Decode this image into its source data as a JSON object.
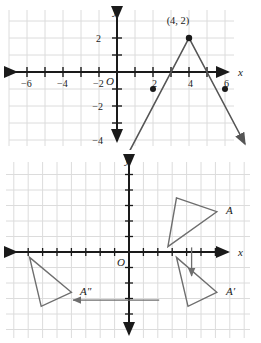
{
  "figure_top": {
    "name": "absolute-value-graph",
    "axis": {
      "x_label": "x",
      "y_label": "y",
      "origin_label": "O",
      "x_ticks": [
        -6,
        -4,
        -2,
        2,
        4,
        6
      ],
      "x_tick_labels": [
        "−6",
        "−4",
        "−2",
        "2",
        "4",
        "6"
      ],
      "y_ticks": [
        -4,
        -2,
        2
      ],
      "y_tick_labels": [
        "−4",
        "−2",
        "2"
      ],
      "x_range": [
        -7,
        7
      ],
      "y_range": [
        -5,
        3
      ]
    },
    "annotations": [
      {
        "text": "(4, 2)",
        "x": 4,
        "y": 2
      }
    ],
    "points": [
      {
        "x": 2,
        "y": -1
      },
      {
        "x": 4,
        "y": 2
      },
      {
        "x": 6,
        "y": -1
      }
    ],
    "polyline": [
      {
        "x": 0.6,
        "y": -4.8
      },
      {
        "x": 4,
        "y": 2
      },
      {
        "x": 7.1,
        "y": -4.2
      }
    ]
  },
  "figure_bottom": {
    "name": "triangle-transformation-graph",
    "axis": {
      "x_label": "x",
      "y_label": "y",
      "origin_label": "O",
      "x_range": [
        -8,
        8
      ],
      "y_range": [
        -5,
        5
      ]
    },
    "triangles": [
      {
        "label": "A",
        "vertices": [
          {
            "x": 3.3,
            "y": 3.5
          },
          {
            "x": 6.1,
            "y": 2.6
          },
          {
            "x": 2.7,
            "y": 0.35
          }
        ],
        "label_pos": {
          "x": 6.7,
          "y": 2.6
        }
      },
      {
        "label": "A′",
        "vertices": [
          {
            "x": 3.3,
            "y": -0.35
          },
          {
            "x": 6.1,
            "y": -2.6
          },
          {
            "x": 4.1,
            "y": -3.5
          }
        ],
        "label_pos": {
          "x": 6.7,
          "y": -2.6
        }
      },
      {
        "label": "A″",
        "vertices": [
          {
            "x": -6.9,
            "y": -0.35
          },
          {
            "x": -4.0,
            "y": -2.6
          },
          {
            "x": -6.1,
            "y": -3.5
          }
        ],
        "label_pos": {
          "x": -3.4,
          "y": -2.6
        }
      }
    ],
    "arrows": [
      {
        "name": "vertical-translation-arrow",
        "from": {
          "x": 4.35,
          "y": 0.3
        },
        "to": {
          "x": 4.35,
          "y": -1.55
        }
      },
      {
        "name": "horizontal-reflection-arrow",
        "from": {
          "x": 2.1,
          "y": -3.1
        },
        "to": {
          "x": -3.9,
          "y": -3.1
        }
      }
    ]
  },
  "colors": {
    "grid": "#dcdcdc",
    "axis": "#1a1a1a",
    "curve": "#555555",
    "shape": "#666666",
    "text": "#1a1a1a",
    "background": "#ffffff"
  }
}
